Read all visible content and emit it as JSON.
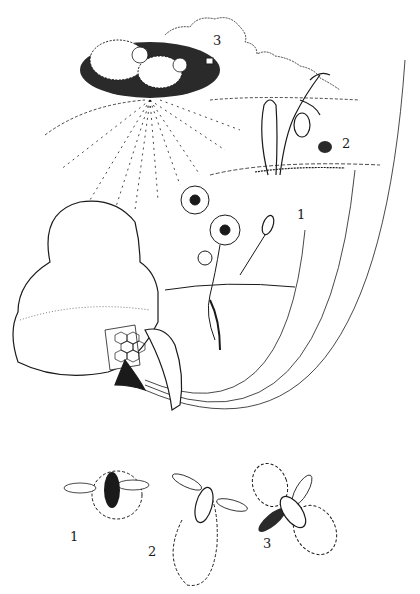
{
  "illustration": {
    "subject": "honeybee foraging distances and recruitment dances",
    "colors": {
      "ink": "#1a1a1a",
      "paper": "#ffffff"
    }
  },
  "scene_labels": [
    {
      "id": "1",
      "text": "1",
      "refers_to": "near flower",
      "x": 297,
      "y": 215
    },
    {
      "id": "2",
      "text": "2",
      "refers_to": "mid-distance flower",
      "x": 342,
      "y": 137
    },
    {
      "id": "3",
      "text": "3",
      "refers_to": "distant shrub",
      "x": 213,
      "y": 34
    }
  ],
  "dance_labels": [
    {
      "id": "1",
      "text": "1",
      "dance": "round dance",
      "x": 70,
      "y": 530
    },
    {
      "id": "2",
      "text": "2",
      "dance": "sickle dance",
      "x": 148,
      "y": 545
    },
    {
      "id": "3",
      "text": "3",
      "dance": "waggle dance",
      "x": 263,
      "y": 537
    }
  ]
}
